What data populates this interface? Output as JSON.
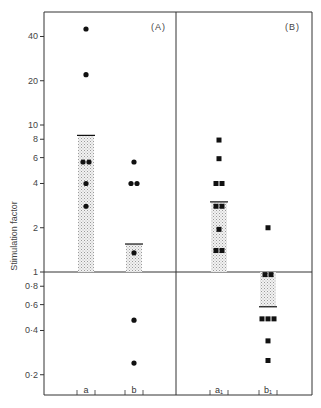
{
  "chart_data": {
    "type": "scatter",
    "subtype": "log-scale dot plot with geometric-mean bars",
    "title": "",
    "xlabel": "",
    "ylabel": "Stimulation factor",
    "yscale": "log",
    "ylim": [
      0.17,
      55
    ],
    "yticks": [
      0.2,
      0.4,
      0.6,
      0.8,
      1,
      2,
      4,
      6,
      8,
      10,
      20,
      40
    ],
    "ytick_labels": [
      "0·2",
      "0·4",
      "0·6",
      "0·8",
      "1",
      "2",
      "4",
      "6",
      "8",
      "10",
      "20",
      "40"
    ],
    "reference_line": 1,
    "grid": false,
    "legend": null,
    "panels": [
      {
        "label": "(A)",
        "marker": "circle",
        "categories": [
          "a",
          "b"
        ],
        "series": [
          {
            "name": "a",
            "values": [
              45,
              22,
              5.6,
              5.6,
              4,
              2.8
            ],
            "bar_mean": 8.5
          },
          {
            "name": "b",
            "values": [
              5.6,
              4,
              4,
              1.35,
              0.47,
              0.24
            ],
            "bar_mean": 1.55
          }
        ]
      },
      {
        "label": "(B)",
        "marker": "square",
        "categories": [
          "a₁",
          "b₁"
        ],
        "series": [
          {
            "name": "a₁",
            "values": [
              7.9,
              5.9,
              4,
              4,
              2.8,
              2.8,
              1.95,
              1.4,
              1.4
            ],
            "bar_mean": 3.0
          },
          {
            "name": "b₁",
            "values": [
              2.0,
              0.96,
              0.96,
              0.48,
              0.48,
              0.48,
              0.34,
              0.25
            ],
            "bar_mean": 0.58
          }
        ]
      }
    ]
  },
  "figure": {
    "ylabel": "Stimulation factor",
    "panel_labels": [
      "(A)",
      "(B)"
    ],
    "category_labels": [
      "a",
      "b",
      "a₁",
      "b₁"
    ],
    "colors": {
      "ink": "#111111",
      "axis": "#333333",
      "bar_fill": "#d9d9d9"
    }
  }
}
